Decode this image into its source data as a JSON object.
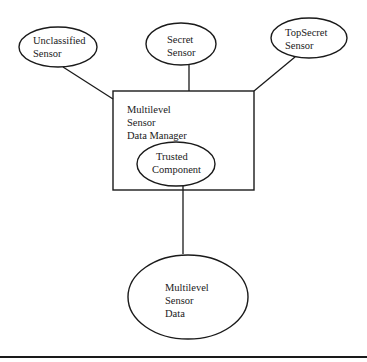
{
  "diagram": {
    "type": "architecture",
    "nodes": {
      "unclassified_sensor": {
        "shape": "ellipse",
        "lines": [
          "Unclassified",
          "Sensor"
        ]
      },
      "secret_sensor": {
        "shape": "ellipse",
        "lines": [
          "Secret",
          "Sensor"
        ]
      },
      "topsecret_sensor": {
        "shape": "ellipse",
        "lines": [
          "TopSecret",
          "Sensor"
        ]
      },
      "data_manager": {
        "shape": "rectangle",
        "lines": [
          "Multilevel",
          "Sensor",
          "Data Manager"
        ]
      },
      "trusted_component": {
        "shape": "ellipse",
        "container": "data_manager",
        "lines": [
          "Trusted",
          "Component"
        ]
      },
      "sensor_data": {
        "shape": "ellipse",
        "lines": [
          "Multilevel",
          "Sensor",
          "Data"
        ]
      }
    },
    "edges": [
      {
        "from": "unclassified_sensor",
        "to": "data_manager"
      },
      {
        "from": "secret_sensor",
        "to": "data_manager"
      },
      {
        "from": "topsecret_sensor",
        "to": "data_manager"
      },
      {
        "from": "trusted_component",
        "to": "sensor_data"
      }
    ],
    "colors": {
      "stroke": "#1a1a1a",
      "background": "#ffffff"
    }
  }
}
